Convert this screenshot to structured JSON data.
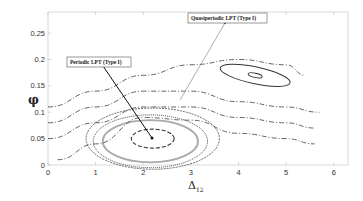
{
  "chart_data": {
    "type": "line",
    "title": "",
    "xlabel": "Δ12",
    "ylabel": "φ",
    "xlim": [
      0,
      6.3
    ],
    "ylim": [
      0,
      0.29
    ],
    "x_ticks": [
      "0",
      "1",
      "2",
      "3",
      "4",
      "5",
      "6"
    ],
    "y_ticks": [
      "0",
      "0.05",
      "0.1",
      "0.15",
      "0.2",
      "0.25"
    ],
    "grid": false,
    "legend": null,
    "annotations": [
      {
        "text": "Periodic LPT (Type I)",
        "points_to": [
          2.2,
          0.05
        ]
      },
      {
        "text": "Quasiperiodic LPT (Type I)",
        "points_to": [
          2.6,
          0.11
        ]
      }
    ],
    "series": [
      {
        "name": "fixed point (periodic LPT)",
        "kind": "point",
        "x": [
          2.2
        ],
        "y": [
          0.05
        ]
      },
      {
        "name": "closed orbit 1 (inner)",
        "kind": "closed",
        "center": [
          2.2,
          0.05
        ],
        "rx": 0.45,
        "ry": 0.018
      },
      {
        "name": "closed orbit 2 (quasiperiodic)",
        "kind": "closed",
        "center": [
          2.15,
          0.045
        ],
        "rx": 1.0,
        "ry": 0.04
      },
      {
        "name": "closed orbit 3",
        "kind": "closed",
        "center": [
          2.15,
          0.045
        ],
        "rx": 1.2,
        "ry": 0.05
      },
      {
        "name": "closed orbit 4",
        "kind": "closed",
        "center": [
          2.2,
          0.05
        ],
        "rx": 1.4,
        "ry": 0.058
      },
      {
        "name": "upper island outer",
        "kind": "closed",
        "center": [
          4.35,
          0.17
        ],
        "rx": 0.75,
        "ry": 0.016
      },
      {
        "name": "upper island inner",
        "kind": "closed",
        "center": [
          4.35,
          0.17
        ],
        "rx": 0.15,
        "ry": 0.004
      },
      {
        "name": "open trajectory 1",
        "kind": "open",
        "x": [
          0,
          1,
          2,
          3,
          4,
          5,
          5.4
        ],
        "y": [
          0.11,
          0.14,
          0.17,
          0.19,
          0.2,
          0.19,
          0.17
        ]
      },
      {
        "name": "open trajectory 2",
        "kind": "open",
        "x": [
          0,
          1,
          2,
          3,
          4,
          5,
          5.7
        ],
        "y": [
          0.08,
          0.11,
          0.14,
          0.14,
          0.12,
          0.11,
          0.1
        ]
      },
      {
        "name": "open trajectory 3",
        "kind": "open",
        "x": [
          0,
          1,
          2,
          3,
          4,
          5,
          5.6
        ],
        "y": [
          0.05,
          0.08,
          0.11,
          0.11,
          0.09,
          0.08,
          0.07
        ]
      },
      {
        "name": "open trajectory 4",
        "kind": "open",
        "x": [
          0.2,
          1,
          2,
          3,
          4,
          5,
          5.6
        ],
        "y": [
          0.01,
          0.04,
          0.09,
          0.085,
          0.06,
          0.05,
          0.04
        ]
      }
    ]
  },
  "labels": {
    "xlabel_main": "Δ",
    "xlabel_sub": "12",
    "ylabel": "φ",
    "annot_periodic": "Periodic LPT (Type I)",
    "annot_quasi": "Quasiperiodic LPT (Type I)"
  }
}
